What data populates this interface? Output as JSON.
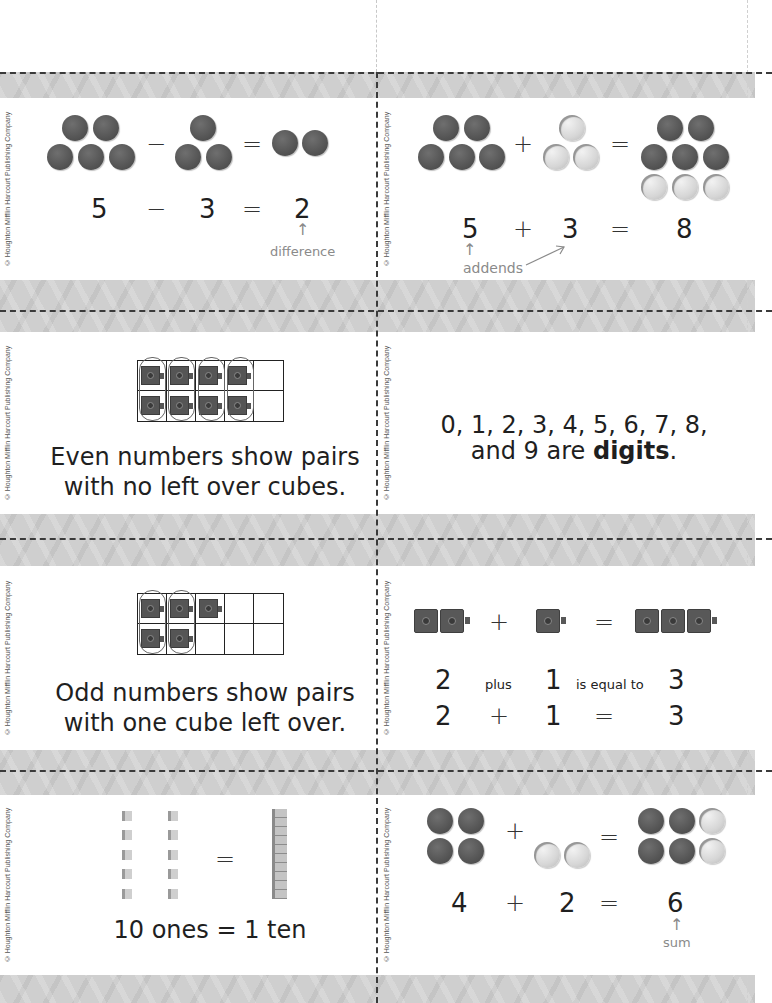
{
  "copyright": "© Houghton Mifflin Harcourt Publishing Company",
  "colors": {
    "band": "#cfcfcf",
    "counter_dark": "#555555",
    "counter_light": "#d6d6d6",
    "note_gray": "#8a8a8a",
    "text": "#1f1f1f"
  },
  "cards": [
    {
      "id": "difference",
      "counters_left": 5,
      "counters_middle": 3,
      "counters_result": 2,
      "equation": {
        "a": "5",
        "op": "−",
        "b": "3",
        "eq": "=",
        "result": "2"
      },
      "label": "difference",
      "arrow": "↑"
    },
    {
      "id": "addends",
      "counters_left": 5,
      "counters_middle": 3,
      "counters_result": 8,
      "equation": {
        "a": "5",
        "op": "+",
        "b": "3",
        "eq": "=",
        "result": "8"
      },
      "label": "addends",
      "arrow": "↑"
    },
    {
      "id": "even-numbers",
      "ten_frame_filled": 8,
      "text_line1": "Even numbers show pairs",
      "text_line2": "with no left over cubes."
    },
    {
      "id": "digits",
      "text_line1": "0, 1, 2, 3, 4, 5, 6, 7, 8,",
      "text_line2_pre": "and 9 are ",
      "text_line2_bold": "digits",
      "text_line2_post": "."
    },
    {
      "id": "odd-numbers",
      "ten_frame_filled": 5,
      "text_line1": "Odd numbers show pairs",
      "text_line2": "with one cube left over."
    },
    {
      "id": "plus-equal",
      "words": {
        "a": "2",
        "op": "plus",
        "b": "1",
        "eq": "is equal to",
        "result": "3"
      },
      "symbols": {
        "a": "2",
        "op": "+",
        "b": "1",
        "eq": "=",
        "result": "3"
      }
    },
    {
      "id": "ones-ten",
      "ones_count": 10,
      "eq": "=",
      "text": "10 ones = 1 ten"
    },
    {
      "id": "sum",
      "counters_left": 4,
      "counters_middle": 2,
      "counters_result": 6,
      "equation": {
        "a": "4",
        "op": "+",
        "b": "2",
        "eq": "=",
        "result": "6"
      },
      "label": "sum",
      "arrow": "↑"
    }
  ]
}
